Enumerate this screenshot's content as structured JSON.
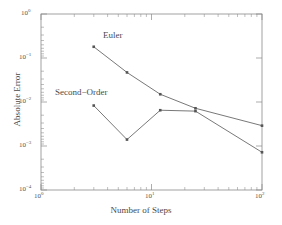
{
  "chart_data": {
    "type": "line",
    "title": "",
    "xlabel": "Number of Steps",
    "ylabel": "Absolute Error",
    "xscale": "log",
    "yscale": "log",
    "xlim": [
      1,
      100
    ],
    "ylim": [
      0.0001,
      1
    ],
    "grid": false,
    "legend": "none (inline annotations)",
    "xticks": [
      "10^0",
      "10^1",
      "10^2"
    ],
    "yticks": [
      "10^0",
      "10^-1",
      "10^-2",
      "10^-3",
      "10^-4"
    ],
    "series": [
      {
        "name": "Euler",
        "x": [
          3,
          6,
          12,
          25,
          100
        ],
        "values": [
          0.18,
          0.047,
          0.015,
          0.0072,
          0.0029
        ],
        "marker": "point",
        "color": "#555555"
      },
      {
        "name": "Second-Order",
        "x": [
          3,
          6,
          12,
          25,
          100
        ],
        "values": [
          0.0083,
          0.0014,
          0.0065,
          0.0062,
          0.00072
        ],
        "marker": "point",
        "color": "#555555"
      }
    ],
    "annotations": [
      {
        "text": "Euler",
        "x": 4.6,
        "y": 0.42
      },
      {
        "text": "Second−Order",
        "x": 1.9,
        "y": 0.022
      }
    ]
  },
  "axes": {
    "x_title": "Number of Steps",
    "y_title": "Absolute Error",
    "x_tick_labels": [
      {
        "mantissa": "10",
        "exponent": "0"
      },
      {
        "mantissa": "10",
        "exponent": "1"
      },
      {
        "mantissa": "10",
        "exponent": "2"
      }
    ],
    "y_tick_labels": [
      {
        "mantissa": "10",
        "exponent": "0"
      },
      {
        "mantissa": "10",
        "exponent": "−1"
      },
      {
        "mantissa": "10",
        "exponent": "−2"
      },
      {
        "mantissa": "10",
        "exponent": "−3"
      },
      {
        "mantissa": "10",
        "exponent": "−4"
      }
    ]
  },
  "labels": {
    "euler": "Euler",
    "second_order": "Second−Order"
  },
  "colors": {
    "line": "#555555",
    "axis": "#8a8a8a",
    "text": "#4a4a4a",
    "background": "#ffffff"
  }
}
